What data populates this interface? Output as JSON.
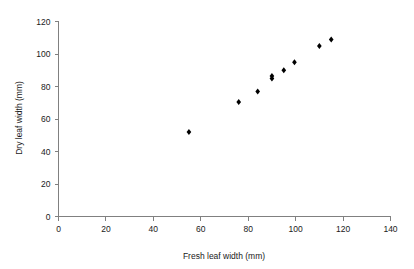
{
  "chart_data": {
    "type": "scatter",
    "title": "",
    "xlabel": "Fresh leaf width (mm)",
    "ylabel": "Dry leaf width (mm)",
    "xlim": [
      0,
      140
    ],
    "ylim": [
      0,
      120
    ],
    "xticks": [
      0,
      20,
      40,
      60,
      80,
      100,
      120,
      140
    ],
    "yticks": [
      0,
      20,
      40,
      60,
      80,
      100,
      120
    ],
    "xtick_labels": [
      "0",
      "20",
      "40",
      "60",
      "80",
      "100",
      "120",
      "140"
    ],
    "ytick_labels": [
      "0",
      "20",
      "40",
      "60",
      "80",
      "100",
      "120"
    ],
    "grid": false,
    "legend": null,
    "marker_color": "#000000",
    "marker_shape": "diamond",
    "axis_color": "#808080",
    "background_color": "#ffffff",
    "series": [
      {
        "name": "leaf width measurements",
        "points": [
          {
            "x": 55,
            "y": 52
          },
          {
            "x": 76,
            "y": 70.5
          },
          {
            "x": 84,
            "y": 77
          },
          {
            "x": 90,
            "y": 85
          },
          {
            "x": 90,
            "y": 86.5
          },
          {
            "x": 95,
            "y": 90
          },
          {
            "x": 99.5,
            "y": 95
          },
          {
            "x": 110,
            "y": 105
          },
          {
            "x": 115,
            "y": 109
          }
        ]
      }
    ]
  }
}
